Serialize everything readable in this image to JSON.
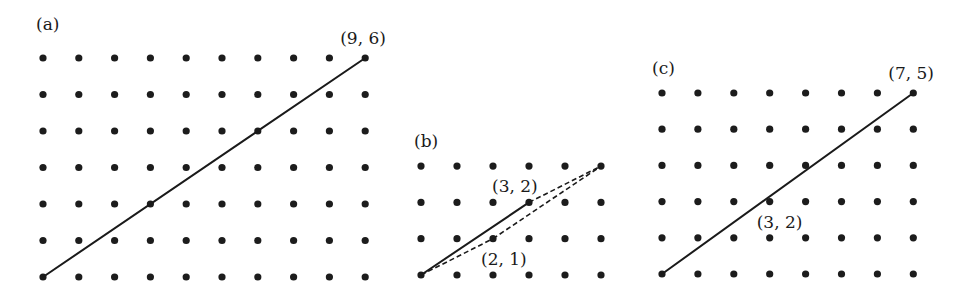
{
  "figure": {
    "panels": [
      {
        "id": "a",
        "label": "(a)",
        "grid": {
          "cols": 10,
          "rows": 7
        },
        "origin_px": [
          43,
          277
        ],
        "spacing_px": [
          35.8,
          36.5
        ],
        "label_px": [
          36,
          30
        ],
        "solid_segments": [
          [
            [
              0,
              0
            ],
            [
              9,
              6
            ]
          ]
        ],
        "dashed_segments": [],
        "point_labels": [
          {
            "text": "(9, 6)",
            "at": [
              9,
              6
            ],
            "offset": [
              -25,
              -14
            ]
          }
        ]
      },
      {
        "id": "b",
        "label": "(b)",
        "grid": {
          "cols": 6,
          "rows": 4
        },
        "origin_px": [
          421,
          275
        ],
        "spacing_px": [
          36,
          36.3
        ],
        "label_px": [
          414,
          147
        ],
        "solid_segments": [
          [
            [
              0,
              0
            ],
            [
              3,
              2
            ]
          ]
        ],
        "dashed_segments": [
          [
            [
              0,
              0
            ],
            [
              2,
              1
            ]
          ],
          [
            [
              2,
              1
            ],
            [
              5,
              3
            ]
          ],
          [
            [
              3,
              2
            ],
            [
              5,
              3
            ]
          ]
        ],
        "point_labels": [
          {
            "text": "(3, 2)",
            "at": [
              3,
              2
            ],
            "offset": [
              -37,
              -10
            ]
          },
          {
            "text": "(2, 1)",
            "at": [
              2,
              1
            ],
            "offset": [
              -12,
              26
            ]
          }
        ]
      },
      {
        "id": "c",
        "label": "(c)",
        "grid": {
          "cols": 8,
          "rows": 6
        },
        "origin_px": [
          662,
          274
        ],
        "spacing_px": [
          35.9,
          36.2
        ],
        "label_px": [
          652,
          74
        ],
        "solid_segments": [
          [
            [
              0,
              0
            ],
            [
              7,
              5
            ]
          ]
        ],
        "dashed_segments": [],
        "point_labels": [
          {
            "text": "(7, 5)",
            "at": [
              7,
              5
            ],
            "offset": [
              -25,
              -14
            ]
          },
          {
            "text": "(3, 2)",
            "at": [
              3,
              2
            ],
            "offset": [
              -13,
              26
            ]
          }
        ]
      }
    ]
  }
}
